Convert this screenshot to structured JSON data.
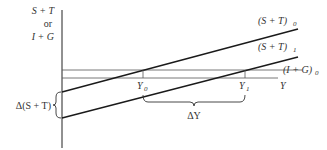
{
  "diagram": {
    "type": "keynesian-cross-shift",
    "y_axis_label": [
      "S + T",
      "or",
      "I + G"
    ],
    "x_axis_label": "Y",
    "lines": [
      {
        "id": "st0",
        "label": "(S + T)",
        "subscript": "0"
      },
      {
        "id": "st1",
        "label": "(S + T)",
        "subscript": "1"
      },
      {
        "id": "ig0",
        "label": "(I + G)",
        "subscript": "0"
      }
    ],
    "equilibria": [
      {
        "label": "Y",
        "subscript": "0"
      },
      {
        "label": "Y",
        "subscript": "1"
      }
    ],
    "annotations": {
      "delta_st": "Δ(S + T)",
      "delta_y": "ΔY"
    },
    "colors": {
      "line": "#1a1a1a",
      "thin_line": "#555555",
      "text": "#333333"
    }
  }
}
